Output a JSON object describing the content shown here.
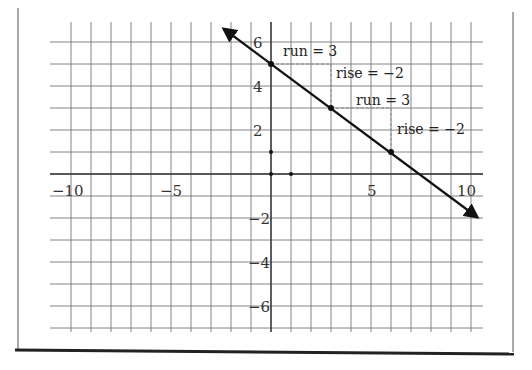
{
  "chart_data": {
    "type": "line",
    "title": "",
    "xlabel": "",
    "ylabel": "",
    "xlim": [
      -11,
      10.5
    ],
    "ylim": [
      -7,
      6.7
    ],
    "grid": true,
    "x_tick_labels": [
      "−10",
      "−5",
      "5",
      "10"
    ],
    "x_tick_values": [
      -10,
      -5,
      5,
      10
    ],
    "y_tick_labels": [
      "6",
      "4",
      "2",
      "−2",
      "−4",
      "−6"
    ],
    "y_tick_values": [
      6,
      4,
      2,
      -2,
      -4,
      -6
    ],
    "series": [
      {
        "name": "line",
        "slope": -0.6667,
        "intercept": 5,
        "points": [
          {
            "x": 0,
            "y": 5
          },
          {
            "x": 3,
            "y": 3
          },
          {
            "x": 6,
            "y": 1
          }
        ],
        "arrow_ends": [
          {
            "x": -2.4,
            "y": 6.6
          },
          {
            "x": 10.4,
            "y": -1.93
          }
        ]
      }
    ],
    "unit_markers": [
      {
        "x": 0,
        "y": 1
      },
      {
        "x": 1,
        "y": 0
      }
    ],
    "annotations": [
      {
        "text": "run = 3",
        "from": {
          "x": 0,
          "y": 5
        },
        "to": {
          "x": 3,
          "y": 5
        }
      },
      {
        "text": "rise = −2",
        "from": {
          "x": 3,
          "y": 5
        },
        "to": {
          "x": 3,
          "y": 3
        }
      },
      {
        "text": "run = 3",
        "from": {
          "x": 3,
          "y": 3
        },
        "to": {
          "x": 6,
          "y": 3
        }
      },
      {
        "text": "rise = −2",
        "from": {
          "x": 6,
          "y": 3
        },
        "to": {
          "x": 6,
          "y": 1
        }
      }
    ]
  },
  "labels": {
    "x": {
      "m10": "−10",
      "m5": "−5",
      "p5": "5",
      "p10": "10"
    },
    "y": {
      "p6": "6",
      "p4": "4",
      "p2": "2",
      "m2": "−2",
      "m4": "−4",
      "m6": "−6"
    },
    "ann": {
      "run1": "run = 3",
      "rise1": "rise = −2",
      "run2": "run = 3",
      "rise2": "rise = −2"
    }
  }
}
